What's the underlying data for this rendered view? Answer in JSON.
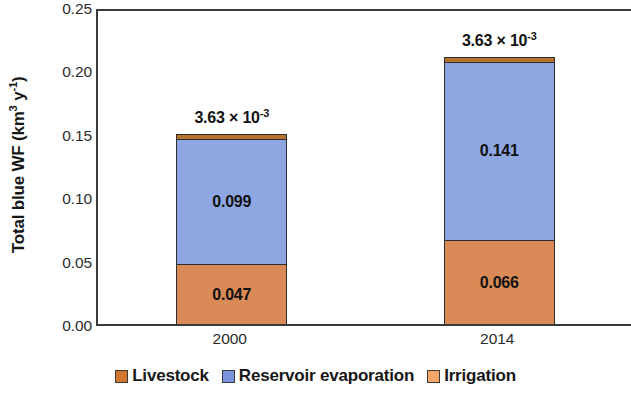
{
  "chart_data": {
    "type": "bar",
    "stacked": true,
    "title": "",
    "xlabel": "",
    "ylabel": "Total blue WF (km3 y-1)",
    "ylabel_parts": {
      "prefix": "Total blue WF (km",
      "sup1": "3",
      "mid": " y",
      "sup2": "-1",
      "suffix": ")"
    },
    "categories": [
      "2000",
      "2014"
    ],
    "ylim": [
      0.0,
      0.25
    ],
    "ytick_values": [
      0.0,
      0.05,
      0.1,
      0.15,
      0.2,
      0.25
    ],
    "ytick_labels": [
      "0.00",
      "0.05",
      "0.10",
      "0.15",
      "0.20",
      "0.25"
    ],
    "grid": false,
    "legend_position": "bottom",
    "series": [
      {
        "name": "Livestock",
        "color": "#B5732F",
        "values": [
          0.00363,
          0.00363
        ],
        "labels": [
          "",
          ""
        ],
        "annotations": [
          "3.63 × 10-3",
          "3.63 × 10-3"
        ],
        "annotation_parts": {
          "mantissa": "3.63 × 10",
          "exponent": "-3"
        }
      },
      {
        "name": "Reservoir evaporation",
        "color": "#8EA7E3",
        "values": [
          0.099,
          0.141
        ],
        "labels": [
          "0.099",
          "0.141"
        ],
        "annotations": [
          "",
          ""
        ]
      },
      {
        "name": "Irrigation",
        "color": "#D98A56",
        "values": [
          0.047,
          0.066
        ],
        "labels": [
          "0.047",
          "0.066"
        ],
        "annotations": [
          "",
          ""
        ]
      }
    ],
    "stack_order_bottom_to_top": [
      "Irrigation",
      "Reservoir evaporation",
      "Livestock"
    ],
    "totals": [
      0.14963,
      0.21063
    ]
  },
  "legend": {
    "items": [
      {
        "label": "Livestock",
        "color": "#D0772F"
      },
      {
        "label": "Reservoir evaporation",
        "color": "#7B93DE"
      },
      {
        "label": "Irrigation",
        "color": "#F2A86B"
      }
    ]
  }
}
